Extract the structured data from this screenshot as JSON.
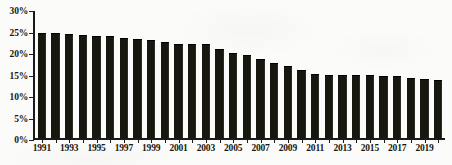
{
  "chart_data": {
    "type": "bar",
    "title": "",
    "subtitle": "",
    "xlabel": "",
    "ylabel": "",
    "ylim": [
      0,
      30
    ],
    "ytick_values": [
      0,
      5,
      10,
      15,
      20,
      25,
      30
    ],
    "ytick_labels": [
      "0%",
      "5%",
      "10%",
      "15%",
      "20%",
      "25%",
      "30%"
    ],
    "grid": false,
    "legend": null,
    "bar_color": "#17160f",
    "axis_color": "#1a1a18",
    "background_color": "#fbfbf9",
    "categories": [
      "1991",
      "1992",
      "1993",
      "1994",
      "1995",
      "1996",
      "1997",
      "1998",
      "1999",
      "2000",
      "2001",
      "2002",
      "2003",
      "2004",
      "2005",
      "2006",
      "2007",
      "2008",
      "2009",
      "2010",
      "2011",
      "2012",
      "2013",
      "2014",
      "2015",
      "2016",
      "2017",
      "2018",
      "2019",
      "2020"
    ],
    "xtick_labels": [
      "1991",
      "1993",
      "1995",
      "1997",
      "1999",
      "2001",
      "2003",
      "2005",
      "2007",
      "2009",
      "2011",
      "2013",
      "2015",
      "2017",
      "2019"
    ],
    "values": [
      24.9,
      24.7,
      24.6,
      24.4,
      24.2,
      24.1,
      23.7,
      23.4,
      23.1,
      22.7,
      22.3,
      22.2,
      22.2,
      21.0,
      20.2,
      19.6,
      18.6,
      17.7,
      16.9,
      16.1,
      15.2,
      15.0,
      15.0,
      14.9,
      14.8,
      14.7,
      14.6,
      14.2,
      14.0,
      13.8
    ],
    "values_percent_of_axis": [
      24.9,
      24.7,
      24.6,
      24.4,
      24.2,
      24.1,
      23.7,
      23.4,
      23.1,
      22.7,
      22.3,
      22.2,
      22.2,
      21.0,
      20.2,
      19.6,
      18.6,
      17.7,
      16.9,
      16.1,
      15.2,
      15.0,
      15.0,
      14.9,
      14.8,
      14.7,
      14.6,
      14.2,
      14.0,
      13.8
    ]
  }
}
